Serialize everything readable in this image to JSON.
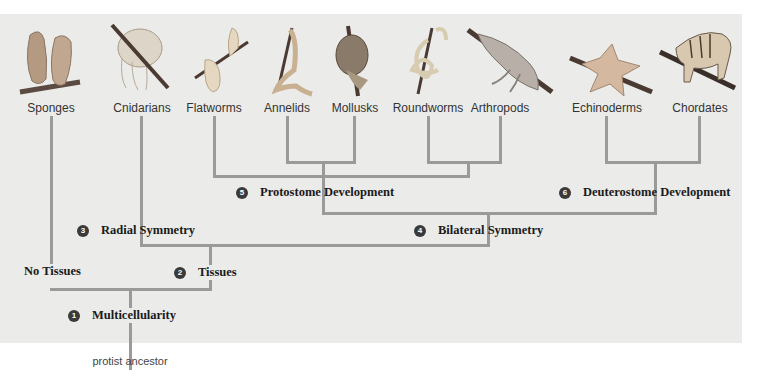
{
  "diagram": {
    "type": "phylogenetic-tree",
    "background_color": "#ebebea",
    "line_color": "#9a9a9a",
    "taxa": [
      {
        "label": "Sponges",
        "icon": "sponge-icon"
      },
      {
        "label": "Cnidarians",
        "icon": "jellyfish-icon"
      },
      {
        "label": "Flatworms",
        "icon": "flatworm-icon"
      },
      {
        "label": "Annelids",
        "icon": "earthworm-icon"
      },
      {
        "label": "Mollusks",
        "icon": "snail-icon"
      },
      {
        "label": "Roundworms",
        "icon": "roundworm-icon"
      },
      {
        "label": "Arthropods",
        "icon": "lobster-icon"
      },
      {
        "label": "Echinoderms",
        "icon": "sea-star-icon"
      },
      {
        "label": "Chordates",
        "icon": "tiger-icon"
      }
    ],
    "nodes": [
      {
        "number": "1",
        "label": "Multicellularity"
      },
      {
        "number": "2",
        "label": "Tissues"
      },
      {
        "number": "3",
        "label": "Radial Symmetry"
      },
      {
        "number": "4",
        "label": "Bilateral Symmetry"
      },
      {
        "number": "5",
        "label": "Protostome Development"
      },
      {
        "number": "6",
        "label": "Deuterostome Development"
      }
    ],
    "unnumbered_nodes": [
      {
        "label": "No Tissues"
      }
    ],
    "root": {
      "label": "protist ancestor"
    }
  }
}
